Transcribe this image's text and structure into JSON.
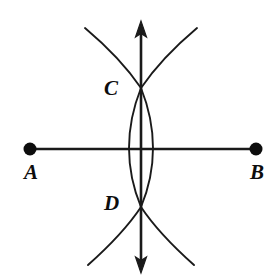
{
  "figure": {
    "background_color": "#ffffff",
    "ink_color": "#1a1a1a",
    "label_color": "#0d0d0d"
  },
  "labels": {
    "a": "A",
    "b": "B",
    "c": "C",
    "d": "D"
  },
  "points": {
    "a": {
      "label": "A",
      "x": 30,
      "y": 149,
      "radius": 6.5,
      "filled": true
    },
    "b": {
      "label": "B",
      "x": 256,
      "y": 149,
      "radius": 6.5,
      "filled": true
    },
    "c": {
      "label": "C",
      "x": 141,
      "y": 88,
      "radius": 0,
      "filled": false
    },
    "d": {
      "label": "D",
      "x": 141,
      "y": 207,
      "radius": 0,
      "filled": false
    }
  },
  "segments": {
    "ab": {
      "name": "segment-AB",
      "x1": 30,
      "y1": 149,
      "x2": 256,
      "y2": 149,
      "stroke_width": 2.6
    }
  },
  "lines": {
    "perpendicular_bisector": {
      "name": "vertical-double-arrow-line",
      "x1": 141,
      "y1": 22,
      "x2": 141,
      "y2": 272,
      "stroke_width": 2.6,
      "arrow_top": true,
      "arrow_bottom": true
    }
  },
  "arcs": {
    "upper_left": {
      "name": "arc-upper-left",
      "start_x": 85,
      "start_y": 28,
      "end_x": 141,
      "end_y": 88,
      "radius": 120,
      "sweep": 1,
      "stroke_width": 1.9
    },
    "upper_right": {
      "name": "arc-upper-right",
      "start_x": 197,
      "start_y": 28,
      "end_x": 141,
      "end_y": 88,
      "radius": 120,
      "sweep": 0,
      "stroke_width": 1.9
    },
    "lower_left": {
      "name": "arc-lower-left",
      "start_x": 88,
      "start_y": 265,
      "end_x": 141,
      "end_y": 207,
      "radius": 120,
      "sweep": 0,
      "stroke_width": 1.9
    },
    "lower_right": {
      "name": "arc-lower-right",
      "start_x": 194,
      "start_y": 265,
      "end_x": 141,
      "end_y": 207,
      "radius": 120,
      "sweep": 1,
      "stroke_width": 1.9
    },
    "lens_left": {
      "name": "arc-lens-left",
      "start_x": 141,
      "start_y": 88,
      "end_x": 141,
      "end_y": 207,
      "bulge_x": 129,
      "stroke_width": 1.9
    },
    "lens_right": {
      "name": "arc-lens-right",
      "start_x": 141,
      "start_y": 88,
      "end_x": 141,
      "end_y": 207,
      "bulge_x": 153,
      "stroke_width": 1.9
    }
  },
  "geometry_paths": {
    "segment_ab": "M 30 149 L 256 149",
    "vertical_line": "M 141 30 L 141 264",
    "arrow_head_top": "M 141 21 L 135.5 37 L 141 33.5 L 146.5 37 Z",
    "arrow_head_bottom": "M 141 273 L 135.5 257 L 141 260.5 L 146.5 257 Z",
    "arc_upper_left": "M 85 28 C 104 44 126 66 141 88",
    "arc_upper_right": "M 197 28 C 178 44 156 66 141 88",
    "arc_lower_left": "M 88 265 C 106 249 127 228 141 207",
    "arc_lower_right": "M 194 265 C 176 249 155 228 141 207",
    "lens_arc_left": "M 141 88 C 131 113 129 135 129 148 C 129 161 131 183 141 207",
    "lens_arc_right": "M 141 88 C 151 113 153 135 153 148 C 153 161 151 183 141 207"
  },
  "canvas": {
    "width": 277,
    "height": 278
  }
}
